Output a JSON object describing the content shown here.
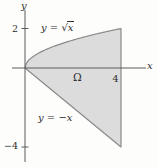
{
  "figure": {
    "type": "math-region-plot",
    "background": "#fdfdfc",
    "colors": {
      "region_fill": "#dcdcdc",
      "region_stroke": "#8a8a8a",
      "axis": "#5a5a5a",
      "text": "#2e2e2e"
    },
    "mapping": {
      "origin_px": [
        25,
        68
      ],
      "px_per_unit_x": 24,
      "px_per_unit_y": 19.75
    },
    "region": {
      "label": "Ω",
      "upper_boundary": "y = √x",
      "lower_boundary": "y = −x",
      "right_boundary": "x = 4",
      "x_domain": [
        0,
        4
      ],
      "vertices": [
        [
          0,
          0
        ],
        [
          4,
          2
        ],
        [
          4,
          -4
        ]
      ]
    },
    "axes": {
      "x_label": "x",
      "y_label": "y",
      "x_ticks": [
        {
          "value": 4,
          "label": "4"
        }
      ],
      "y_ticks": [
        {
          "value": 2,
          "label": "2"
        },
        {
          "value": -4,
          "label": "−4"
        }
      ]
    }
  },
  "labels": {
    "y_axis": "y",
    "x_axis": "x",
    "tick_2": "2",
    "tick_neg4": "−4",
    "tick_4": "4",
    "upper_prefix": "y = ",
    "radical_sign": "√",
    "radicand": "x",
    "region": "Ω",
    "lower": "y = −x"
  },
  "chart_data": {
    "type": "area",
    "title": "",
    "xlabel": "x",
    "ylabel": "y",
    "x_domain": [
      0,
      4
    ],
    "ylim": [
      -4,
      2
    ],
    "x_ticks": [
      4
    ],
    "y_ticks": [
      2,
      -4
    ],
    "region_label": "Ω",
    "curves": [
      {
        "label": "y = √x",
        "expr": "sqrt(x)",
        "role": "upper-boundary"
      },
      {
        "label": "y = −x",
        "expr": "-x",
        "role": "lower-boundary"
      },
      {
        "label": "x = 4",
        "expr": "x=4",
        "role": "right-boundary"
      }
    ]
  }
}
